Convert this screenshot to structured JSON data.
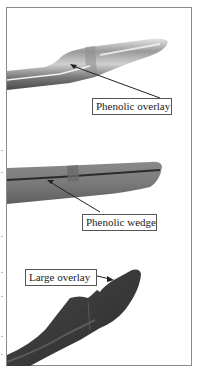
{
  "figure": {
    "panels": [
      {
        "id": "top",
        "subject": "tool-with-phenolic-overlay",
        "label": "Phenolic overlay"
      },
      {
        "id": "middle",
        "subject": "tool-with-phenolic-wedge",
        "label": "Phenolic wedge"
      },
      {
        "id": "bottom",
        "subject": "tool-with-large-overlay",
        "label": "Large overlay"
      }
    ],
    "colors": {
      "frame": "#8a8a8a",
      "label_border": "#555555",
      "arrow": "#222222",
      "tool_light": "#d8d8d8",
      "tool_mid": "#8c8c8c",
      "tool_dark": "#3c3c3c"
    }
  }
}
